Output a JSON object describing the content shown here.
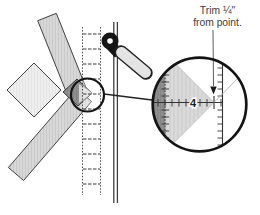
{
  "annotation": {
    "line1": "Trim ¼\"",
    "line2": "from point."
  },
  "magnifier": {
    "ruler_number": "4"
  },
  "icons": {
    "rotary_cutter": "rotary-cutter-icon",
    "magnifier_circle": "magnifier-circle",
    "callout_circle": "callout-source-circle",
    "arrow": "trim-arrowhead"
  },
  "colors": {
    "background": "#ffffff",
    "outline": "#141414",
    "fabric_strip": "#d8d8d8",
    "fabric_overlap": "#8f8f8f",
    "pale_patch": "#eeeeee",
    "ruler_lines": "#3a3a3a",
    "annotation_text": "#3d3d3d"
  }
}
